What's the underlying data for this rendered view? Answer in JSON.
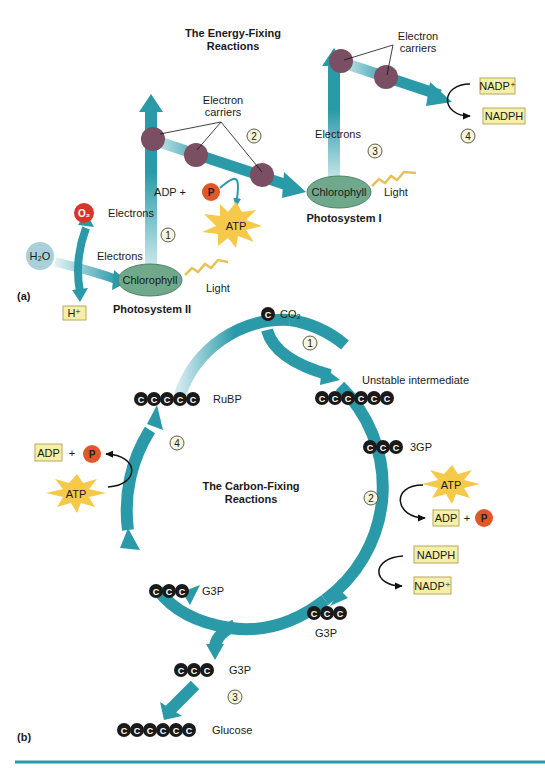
{
  "colors": {
    "arrow": "#2a9aa8",
    "arrow_light": "#cfe9ee",
    "carrier": "#7a4f63",
    "chlorophyll": "#6fa88a",
    "box_fill": "#f6f0a6",
    "box_stroke": "#b8a860",
    "phosphate": "#e0582a",
    "oxygen": "#d8352a",
    "water": "#a9cfd8",
    "atp_star": "#f6c94a",
    "carbon": "#1a1a1a",
    "step_fill": "#f8f5d8",
    "rule": "#2a9aa8"
  },
  "header_partial": "",
  "panel_a": {
    "label": "(a)",
    "title_line1": "The Energy-Fixing",
    "title_line2": "Reactions",
    "electron_carriers_1": [
      "Electron",
      "carriers"
    ],
    "electron_carriers_2": [
      "Electron",
      "carriers"
    ],
    "electrons_ps2_up": "Electrons",
    "electrons_water": "Electrons",
    "electrons_ps1_up": "Electrons",
    "chlorophyll_ps2": "Chlorophyll",
    "chlorophyll_ps1": "Chlorophyll",
    "light_ps2": "Light",
    "light_ps1": "Light",
    "photosystem2": "Photosystem II",
    "photosystem1": "Photosystem I",
    "water": "H₂O",
    "oxygen": "O₂",
    "proton": "H⁺",
    "adp_plus": "ADP +",
    "phosphate": "P",
    "atp": "ATP",
    "nadp_plus": "NADP⁺",
    "nadph": "NADPH",
    "steps": [
      "1",
      "2",
      "3",
      "4"
    ]
  },
  "panel_b": {
    "label": "(b)",
    "title_line1": "The Carbon-Fixing",
    "title_line2": "Reactions",
    "carbon_symbol": "C",
    "co2": "CO₂",
    "unstable": "Unstable intermediate",
    "pga": "3GP",
    "rubp": "RuBP",
    "g3p_right": "G3P",
    "g3p_left": "G3P",
    "g3p_out": "G3P",
    "glucose": "Glucose",
    "atp_right": "ATP",
    "adp_right": "ADP",
    "plus": "+",
    "p_right": "P",
    "nadph": "NADPH",
    "nadp_plus": "NADP⁺",
    "adp_left": "ADP",
    "p_left": "P",
    "atp_left": "ATP",
    "steps": [
      "1",
      "2",
      "3",
      "4"
    ]
  }
}
